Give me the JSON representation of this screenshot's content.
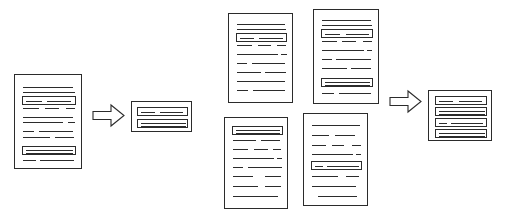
{
  "diagram": {
    "title": "Document summarization flow",
    "stroke_color": "#2b2b2b",
    "background_color": "#ffffff",
    "stages": [
      {
        "id": "stage-single-source",
        "label": "single source document"
      },
      {
        "id": "stage-single-summary",
        "label": "single document summary"
      },
      {
        "id": "stage-multi-source",
        "label": "multiple source documents"
      },
      {
        "id": "stage-multi-summary",
        "label": "multi document summary"
      }
    ]
  },
  "nodes": {
    "source_document": {
      "name": "source-document",
      "label": "Source document",
      "x": 14,
      "y": 74,
      "w": 68,
      "h": 95,
      "lines": [
        {
          "x": 8,
          "y": 12,
          "w": 50
        },
        {
          "x": 8,
          "y": 17,
          "w": 52
        },
        {
          "x": 8,
          "y": 33,
          "w": 16
        },
        {
          "x": 30,
          "y": 33,
          "w": 14
        },
        {
          "x": 51,
          "y": 33,
          "w": 9
        },
        {
          "x": 8,
          "y": 42,
          "w": 50
        },
        {
          "x": 8,
          "y": 47,
          "w": 40
        },
        {
          "x": 53,
          "y": 47,
          "w": 7
        },
        {
          "x": 8,
          "y": 56,
          "w": 11
        },
        {
          "x": 24,
          "y": 56,
          "w": 34
        },
        {
          "x": 8,
          "y": 62,
          "w": 27
        },
        {
          "x": 40,
          "y": 62,
          "w": 19
        },
        {
          "x": 8,
          "y": 85,
          "w": 13
        },
        {
          "x": 25,
          "y": 85,
          "w": 34
        }
      ],
      "highlights": [
        {
          "x": 7,
          "y": 21,
          "w": 54,
          "h": 9,
          "bars": [
            {
              "x": 3,
              "y": 4,
              "w": 16
            },
            {
              "x": 24,
              "y": 4,
              "w": 24
            }
          ]
        },
        {
          "x": 7,
          "y": 71,
          "w": 54,
          "h": 9,
          "bars": [
            {
              "x": 3,
              "y": 3,
              "w": 47
            },
            {
              "x": 3,
              "y": 6,
              "w": 47
            }
          ]
        }
      ]
    },
    "single_summary": {
      "name": "single-document-summary",
      "label": "Single document summary",
      "x": 131,
      "y": 101,
      "w": 61,
      "h": 31,
      "highlights": [
        {
          "x": 5,
          "y": 5,
          "w": 51,
          "h": 9,
          "bars": [
            {
              "x": 3,
              "y": 4,
              "w": 14
            },
            {
              "x": 22,
              "y": 4,
              "w": 23
            }
          ]
        },
        {
          "x": 5,
          "y": 17,
          "w": 51,
          "h": 9,
          "bars": [
            {
              "x": 3,
              "y": 3,
              "w": 45
            },
            {
              "x": 3,
              "y": 6,
              "w": 45
            }
          ]
        }
      ]
    },
    "multi_doc_1": {
      "name": "multi-source-document-top-left",
      "label": "Source document 1",
      "x": 228,
      "y": 13,
      "w": 65,
      "h": 90,
      "lines": [
        {
          "x": 8,
          "y": 10,
          "w": 48
        },
        {
          "x": 8,
          "y": 15,
          "w": 49
        },
        {
          "x": 8,
          "y": 31,
          "w": 15
        },
        {
          "x": 29,
          "y": 31,
          "w": 13
        },
        {
          "x": 48,
          "y": 31,
          "w": 9
        },
        {
          "x": 8,
          "y": 40,
          "w": 41
        },
        {
          "x": 52,
          "y": 40,
          "w": 6
        },
        {
          "x": 8,
          "y": 49,
          "w": 10
        },
        {
          "x": 23,
          "y": 49,
          "w": 33
        },
        {
          "x": 8,
          "y": 58,
          "w": 24
        },
        {
          "x": 36,
          "y": 58,
          "w": 21
        },
        {
          "x": 8,
          "y": 67,
          "w": 48
        },
        {
          "x": 8,
          "y": 76,
          "w": 11
        },
        {
          "x": 24,
          "y": 76,
          "w": 32
        }
      ],
      "highlights": [
        {
          "x": 7,
          "y": 19,
          "w": 51,
          "h": 9,
          "bars": [
            {
              "x": 3,
              "y": 4,
              "w": 14
            },
            {
              "x": 22,
              "y": 4,
              "w": 24
            }
          ]
        }
      ]
    },
    "multi_doc_2": {
      "name": "multi-source-document-top-right",
      "label": "Source document 2",
      "x": 313,
      "y": 9,
      "w": 66,
      "h": 95,
      "lines": [
        {
          "x": 8,
          "y": 10,
          "w": 49
        },
        {
          "x": 8,
          "y": 15,
          "w": 50
        },
        {
          "x": 8,
          "y": 31,
          "w": 15
        },
        {
          "x": 28,
          "y": 31,
          "w": 14
        },
        {
          "x": 49,
          "y": 31,
          "w": 9
        },
        {
          "x": 8,
          "y": 40,
          "w": 42
        },
        {
          "x": 53,
          "y": 40,
          "w": 5
        },
        {
          "x": 8,
          "y": 49,
          "w": 10
        },
        {
          "x": 22,
          "y": 49,
          "w": 35
        },
        {
          "x": 8,
          "y": 58,
          "w": 25
        },
        {
          "x": 37,
          "y": 58,
          "w": 20
        },
        {
          "x": 8,
          "y": 83,
          "w": 12
        },
        {
          "x": 25,
          "y": 83,
          "w": 32
        }
      ],
      "highlights": [
        {
          "x": 7,
          "y": 19,
          "w": 52,
          "h": 9,
          "bars": [
            {
              "x": 3,
              "y": 4,
              "w": 15
            },
            {
              "x": 24,
              "y": 4,
              "w": 23
            }
          ]
        },
        {
          "x": 7,
          "y": 68,
          "w": 52,
          "h": 9,
          "bars": [
            {
              "x": 3,
              "y": 3,
              "w": 45
            },
            {
              "x": 3,
              "y": 6,
              "w": 45
            }
          ]
        }
      ]
    },
    "multi_doc_3": {
      "name": "multi-source-document-bottom-left",
      "label": "Source document 3",
      "x": 224,
      "y": 117,
      "w": 64,
      "h": 92,
      "lines": [
        {
          "x": 8,
          "y": 22,
          "w": 23
        },
        {
          "x": 36,
          "y": 22,
          "w": 19
        },
        {
          "x": 8,
          "y": 31,
          "w": 15
        },
        {
          "x": 29,
          "y": 31,
          "w": 14
        },
        {
          "x": 48,
          "y": 31,
          "w": 8
        },
        {
          "x": 8,
          "y": 40,
          "w": 41
        },
        {
          "x": 52,
          "y": 40,
          "w": 5
        },
        {
          "x": 8,
          "y": 49,
          "w": 10
        },
        {
          "x": 23,
          "y": 49,
          "w": 34
        },
        {
          "x": 8,
          "y": 58,
          "w": 20
        },
        {
          "x": 40,
          "y": 58,
          "w": 16
        },
        {
          "x": 8,
          "y": 68,
          "w": 25
        },
        {
          "x": 40,
          "y": 68,
          "w": 16
        },
        {
          "x": 8,
          "y": 78,
          "w": 45
        }
      ],
      "highlights": [
        {
          "x": 7,
          "y": 8,
          "w": 51,
          "h": 9,
          "bars": [
            {
              "x": 3,
              "y": 3,
              "w": 44
            },
            {
              "x": 3,
              "y": 6,
              "w": 44
            }
          ]
        }
      ]
    },
    "multi_doc_4": {
      "name": "multi-source-document-bottom-right",
      "label": "Source document 4",
      "x": 303,
      "y": 113,
      "w": 65,
      "h": 93,
      "lines": [
        {
          "x": 8,
          "y": 11,
          "w": 48
        },
        {
          "x": 8,
          "y": 21,
          "w": 17
        },
        {
          "x": 31,
          "y": 21,
          "w": 20
        },
        {
          "x": 8,
          "y": 31,
          "w": 14
        },
        {
          "x": 28,
          "y": 31,
          "w": 12
        },
        {
          "x": 48,
          "y": 31,
          "w": 9
        },
        {
          "x": 8,
          "y": 40,
          "w": 41
        },
        {
          "x": 52,
          "y": 40,
          "w": 5
        },
        {
          "x": 8,
          "y": 62,
          "w": 26
        },
        {
          "x": 42,
          "y": 62,
          "w": 13
        },
        {
          "x": 8,
          "y": 72,
          "w": 44
        },
        {
          "x": 14,
          "y": 82,
          "w": 39
        }
      ],
      "highlights": [
        {
          "x": 7,
          "y": 47,
          "w": 51,
          "h": 9,
          "bars": [
            {
              "x": 3,
              "y": 4,
              "w": 8
            },
            {
              "x": 15,
              "y": 4,
              "w": 32
            }
          ]
        }
      ]
    },
    "multi_summary": {
      "name": "multi-document-summary",
      "label": "Multi document summary",
      "x": 428,
      "y": 90,
      "w": 64,
      "h": 51,
      "highlights": [
        {
          "x": 6,
          "y": 5,
          "w": 52,
          "h": 9,
          "bars": [
            {
              "x": 3,
              "y": 4,
              "w": 14
            },
            {
              "x": 23,
              "y": 4,
              "w": 23
            }
          ]
        },
        {
          "x": 6,
          "y": 16,
          "w": 52,
          "h": 9,
          "bars": [
            {
              "x": 3,
              "y": 3,
              "w": 46
            },
            {
              "x": 3,
              "y": 6,
              "w": 46
            }
          ]
        },
        {
          "x": 6,
          "y": 27,
          "w": 52,
          "h": 9,
          "bars": [
            {
              "x": 3,
              "y": 4,
              "w": 8
            },
            {
              "x": 15,
              "y": 4,
              "w": 32
            }
          ]
        },
        {
          "x": 6,
          "y": 38,
          "w": 52,
          "h": 9,
          "bars": [
            {
              "x": 3,
              "y": 3,
              "w": 46
            },
            {
              "x": 3,
              "y": 6,
              "w": 46
            }
          ]
        }
      ]
    }
  },
  "arrows": [
    {
      "name": "arrow-single-to-summary",
      "label": "summarize",
      "x": 92,
      "y": 103,
      "w": 33,
      "h": 25
    },
    {
      "name": "arrow-multi-to-summary",
      "label": "summarize",
      "x": 389,
      "y": 89,
      "w": 33,
      "h": 25
    }
  ]
}
